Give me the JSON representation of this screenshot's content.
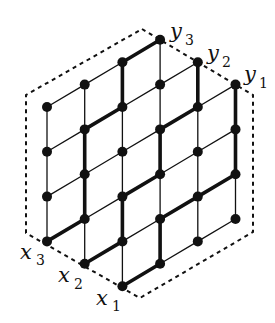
{
  "diagram": {
    "colors": {
      "ink": "#111111",
      "background": "#ffffff"
    },
    "grid": {
      "origin": [
        47,
        107
      ],
      "col_step": [
        37.7,
        -22.4
      ],
      "row_step": [
        0,
        44.8
      ],
      "columns": [
        {
          "col": 0,
          "rows": [
            0,
            3
          ]
        },
        {
          "col": 1,
          "rows": [
            0,
            4
          ]
        },
        {
          "col": 2,
          "rows": [
            0,
            5
          ]
        },
        {
          "col": 3,
          "rows": [
            0,
            5
          ]
        },
        {
          "col": 4,
          "rows": [
            1,
            5
          ]
        },
        {
          "col": 5,
          "rows": [
            2,
            5
          ]
        }
      ]
    },
    "paths": [
      {
        "name": "path-x3-y3",
        "from": "x3",
        "to": "y3",
        "nodes": [
          [
            0,
            3
          ],
          [
            1,
            3
          ],
          [
            1,
            2
          ],
          [
            1,
            1
          ],
          [
            2,
            1
          ],
          [
            2,
            0
          ],
          [
            3,
            0
          ]
        ]
      },
      {
        "name": "path-x2-y2",
        "from": "x2",
        "to": "y2",
        "nodes": [
          [
            1,
            4
          ],
          [
            2,
            4
          ],
          [
            2,
            3
          ],
          [
            3,
            3
          ],
          [
            3,
            2
          ],
          [
            4,
            2
          ],
          [
            4,
            1
          ]
        ]
      },
      {
        "name": "path-x1-y1",
        "from": "x1",
        "to": "y1",
        "nodes": [
          [
            2,
            5
          ],
          [
            3,
            5
          ],
          [
            3,
            4
          ],
          [
            4,
            4
          ],
          [
            5,
            4
          ],
          [
            5,
            3
          ],
          [
            5,
            2
          ]
        ]
      }
    ],
    "boundary": [
      [
        142,
        29
      ],
      [
        253,
        95
      ],
      [
        253,
        232
      ],
      [
        140,
        298
      ],
      [
        26,
        233
      ],
      [
        26,
        95
      ]
    ],
    "labels": [
      {
        "name": "label-y3",
        "base": "y",
        "sub": "3",
        "x": 170,
        "y": 38,
        "subx": 185,
        "suby": 45
      },
      {
        "name": "label-y2",
        "base": "y",
        "sub": "2",
        "x": 207,
        "y": 60,
        "subx": 222,
        "suby": 67
      },
      {
        "name": "label-y1",
        "base": "y",
        "sub": "1",
        "x": 244,
        "y": 81,
        "subx": 259,
        "suby": 88
      },
      {
        "name": "label-x3",
        "base": "x",
        "sub": "3",
        "x": 20,
        "y": 259,
        "subx": 36,
        "suby": 265
      },
      {
        "name": "label-x2",
        "base": "x",
        "sub": "2",
        "x": 58,
        "y": 282,
        "subx": 74,
        "suby": 289
      },
      {
        "name": "label-x1",
        "base": "x",
        "sub": "1",
        "x": 96,
        "y": 305,
        "subx": 112,
        "suby": 311
      }
    ]
  }
}
